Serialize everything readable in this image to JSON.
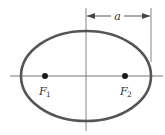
{
  "diagram": {
    "type": "ellipse-with-foci",
    "labels": {
      "semi_major_axis": "a",
      "focus_1": "F",
      "focus_1_sub": "1",
      "focus_2": "F",
      "focus_2_sub": "2"
    },
    "colors": {
      "ellipse_stroke": "#555555",
      "axis_stroke": "#666666",
      "focus_fill": "#1a1a1a",
      "text": "#333333"
    },
    "geometry": {
      "center": [
        86,
        76
      ],
      "rx": 65,
      "ry": 45,
      "foci_x": [
        45,
        125
      ],
      "axis_x_range": [
        10,
        163
      ],
      "axis_y_range": [
        8,
        131
      ]
    }
  }
}
